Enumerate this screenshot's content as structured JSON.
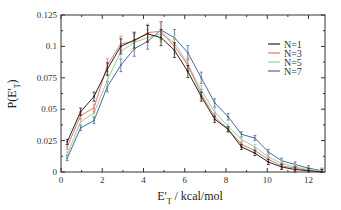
{
  "chart_data": {
    "type": "line",
    "title": "",
    "xlabel": "E'T / kcal/mol",
    "xlabel_main": "E'",
    "xlabel_sub": "T",
    "xlabel_rest": " / kcal/mol",
    "ylabel": "P(E'T)",
    "ylabel_main": "P(E'",
    "ylabel_sub": "T",
    "ylabel_rest": ")",
    "xlim": [
      0,
      12.8
    ],
    "ylim": [
      0,
      0.125
    ],
    "xticks": [
      0,
      2,
      4,
      6,
      8,
      10,
      12
    ],
    "xtick_labels": [
      "0",
      "2",
      "4",
      "6",
      "8",
      "10",
      "12"
    ],
    "yticks": [
      0,
      0.025,
      0.05,
      0.075,
      0.1,
      0.125
    ],
    "ytick_labels": [
      "0",
      "0.025",
      "0.05",
      "0.075",
      "0.1",
      "0.125"
    ],
    "grid": false,
    "legend_position": "right",
    "error_bars": true,
    "x": [
      0.3,
      0.95,
      1.6,
      2.25,
      2.9,
      3.55,
      4.2,
      4.85,
      5.5,
      6.15,
      6.8,
      7.45,
      8.1,
      8.75,
      9.4,
      10.05,
      10.7,
      11.35,
      12.0,
      12.65
    ],
    "series": [
      {
        "name": "N=1",
        "color": "#222222",
        "values": [
          0.024,
          0.048,
          0.06,
          0.082,
          0.1,
          0.105,
          0.11,
          0.107,
          0.097,
          0.08,
          0.06,
          0.042,
          0.034,
          0.02,
          0.015,
          0.008,
          0.004,
          0.002,
          0.001,
          0.0
        ]
      },
      {
        "name": "N=3",
        "color": "#e07a6a",
        "values": [
          0.02,
          0.045,
          0.051,
          0.085,
          0.102,
          0.104,
          0.111,
          0.112,
          0.1,
          0.085,
          0.062,
          0.044,
          0.034,
          0.022,
          0.017,
          0.01,
          0.005,
          0.003,
          0.001,
          0.0
        ]
      },
      {
        "name": "N=5",
        "color": "#9ec9a8",
        "values": [
          0.014,
          0.04,
          0.047,
          0.073,
          0.096,
          0.103,
          0.107,
          0.11,
          0.103,
          0.086,
          0.065,
          0.048,
          0.036,
          0.026,
          0.02,
          0.012,
          0.007,
          0.004,
          0.002,
          0.001
        ]
      },
      {
        "name": "N=7",
        "color": "#4a6a9a",
        "values": [
          0.011,
          0.035,
          0.041,
          0.068,
          0.085,
          0.098,
          0.104,
          0.113,
          0.107,
          0.095,
          0.075,
          0.055,
          0.044,
          0.03,
          0.027,
          0.016,
          0.009,
          0.006,
          0.003,
          0.001
        ]
      }
    ]
  }
}
